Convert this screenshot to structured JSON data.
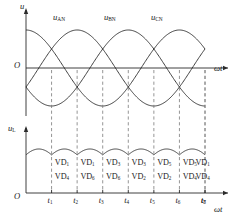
{
  "figure": {
    "stroke_color": "#2b2b2b",
    "dash_color": "#7a7a7a"
  },
  "top_plot": {
    "y_axis_label": "u",
    "x_axis_label": "ωt",
    "origin_label": "O",
    "phase_labels": [
      {
        "text": "u",
        "sub": "AN"
      },
      {
        "text": "u",
        "sub": "BN"
      },
      {
        "text": "u",
        "sub": "CN"
      }
    ]
  },
  "bottom_plot": {
    "y_axis_label": "u",
    "y_axis_sub": "L",
    "x_axis_label": "ωt",
    "origin_label": "O"
  },
  "time_ticks": [
    "t₁",
    "t₂",
    "t₃",
    "t₄",
    "t₅",
    "t₆",
    "t₇",
    "t₈"
  ],
  "tick_bases": [
    "t",
    "t",
    "t",
    "t",
    "t",
    "t",
    "t",
    "t"
  ],
  "tick_subs": [
    "1",
    "2",
    "3",
    "4",
    "5",
    "6",
    "7",
    "8"
  ],
  "conducting_pairs": [
    {
      "upper": "VD₁",
      "lower": "VD₄",
      "upper_base": "VD",
      "upper_sub": "1",
      "lower_base": "VD",
      "lower_sub": "4"
    },
    {
      "upper": "VD₁",
      "lower": "VD₆",
      "upper_base": "VD",
      "upper_sub": "1",
      "lower_base": "VD",
      "lower_sub": "6"
    },
    {
      "upper": "VD₃",
      "lower": "VD₆",
      "upper_base": "VD",
      "upper_sub": "3",
      "lower_base": "VD",
      "lower_sub": "6"
    },
    {
      "upper": "VD₃",
      "lower": "VD₂",
      "upper_base": "VD",
      "upper_sub": "3",
      "lower_base": "VD",
      "lower_sub": "2"
    },
    {
      "upper": "VD₅",
      "lower": "VD₂",
      "upper_base": "VD",
      "upper_sub": "5",
      "lower_base": "VD",
      "lower_sub": "2"
    },
    {
      "upper": "VD₅",
      "lower": "VD₄",
      "upper_base": "VD",
      "upper_sub": "5",
      "lower_base": "VD",
      "lower_sub": "4"
    },
    {
      "upper": "VD₁",
      "lower": "VD₄",
      "upper_base": "VD",
      "upper_sub": "1",
      "lower_base": "VD",
      "lower_sub": "4"
    }
  ],
  "chart_data": {
    "type": "line",
    "xlabel": "ωt",
    "ylabel": "u",
    "grid": false,
    "legend": [
      "u_AN",
      "u_BN",
      "u_CN"
    ],
    "legend_position": "inline-above-curves",
    "x_unit": "degrees",
    "x_range_deg": [
      -30,
      390
    ],
    "amplitude": 1.0,
    "series": [
      {
        "name": "u_AN",
        "phase_deg": 0,
        "formula": "sin(wt)"
      },
      {
        "name": "u_BN",
        "phase_deg": -120,
        "formula": "sin(wt-120)"
      },
      {
        "name": "u_CN",
        "phase_deg": -240,
        "formula": "sin(wt-240)"
      }
    ],
    "rectified": {
      "name": "u_L",
      "formula": "max(uA,uB,uC) - min(uA,uB,uC)",
      "peak": 1.732,
      "valley": 1.5,
      "ripple_pulses_per_cycle": 6
    },
    "commutation_points_deg": [
      30,
      90,
      150,
      210,
      270,
      330,
      390
    ],
    "commutation_labels": [
      "t1",
      "t2",
      "t3",
      "t4",
      "t5",
      "t6",
      "t7",
      "t8"
    ]
  }
}
